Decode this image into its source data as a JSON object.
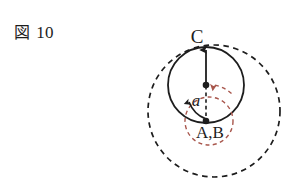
{
  "figure": {
    "caption_kanji": "図",
    "caption_number": "10",
    "labels": {
      "top_point": "C",
      "bottom_point": "A,B",
      "angle": "a"
    },
    "colors": {
      "ink": "#1d1d1d",
      "accent_red": "#a8564c",
      "background": "#ffffff"
    },
    "geometry": {
      "outer_dashed_circle": {
        "cx": 214,
        "cy": 111,
        "r": 66,
        "style": "dashed",
        "color": "#1d1d1d"
      },
      "solid_circle": {
        "cx": 206,
        "cy": 85,
        "r": 38,
        "style": "solid",
        "color": "#1d1d1d"
      },
      "red_dashed_circle": {
        "cx": 209,
        "cy": 121,
        "r": 24,
        "style": "dashed",
        "color": "#a8564c"
      },
      "center_dot": {
        "cx": 206,
        "cy": 85,
        "r": 3.2
      },
      "lower_dot": {
        "cx": 206,
        "cy": 121,
        "r": 3.2
      },
      "vertical_arrow": {
        "x": 206,
        "y_from": 85,
        "y_to": 47,
        "style": "solid",
        "arrowhead": "up"
      },
      "vertical_dashed_segment": {
        "x": 206,
        "y_from": 85,
        "y_to": 121,
        "style": "dashed"
      },
      "angle_arc": {
        "from": "lower_dot",
        "sweep": "counterclockwise",
        "color": "#1d1d1d"
      },
      "red_arrow": {
        "points_to": "center_dot",
        "direction": "left",
        "color": "#a8564c"
      }
    }
  }
}
